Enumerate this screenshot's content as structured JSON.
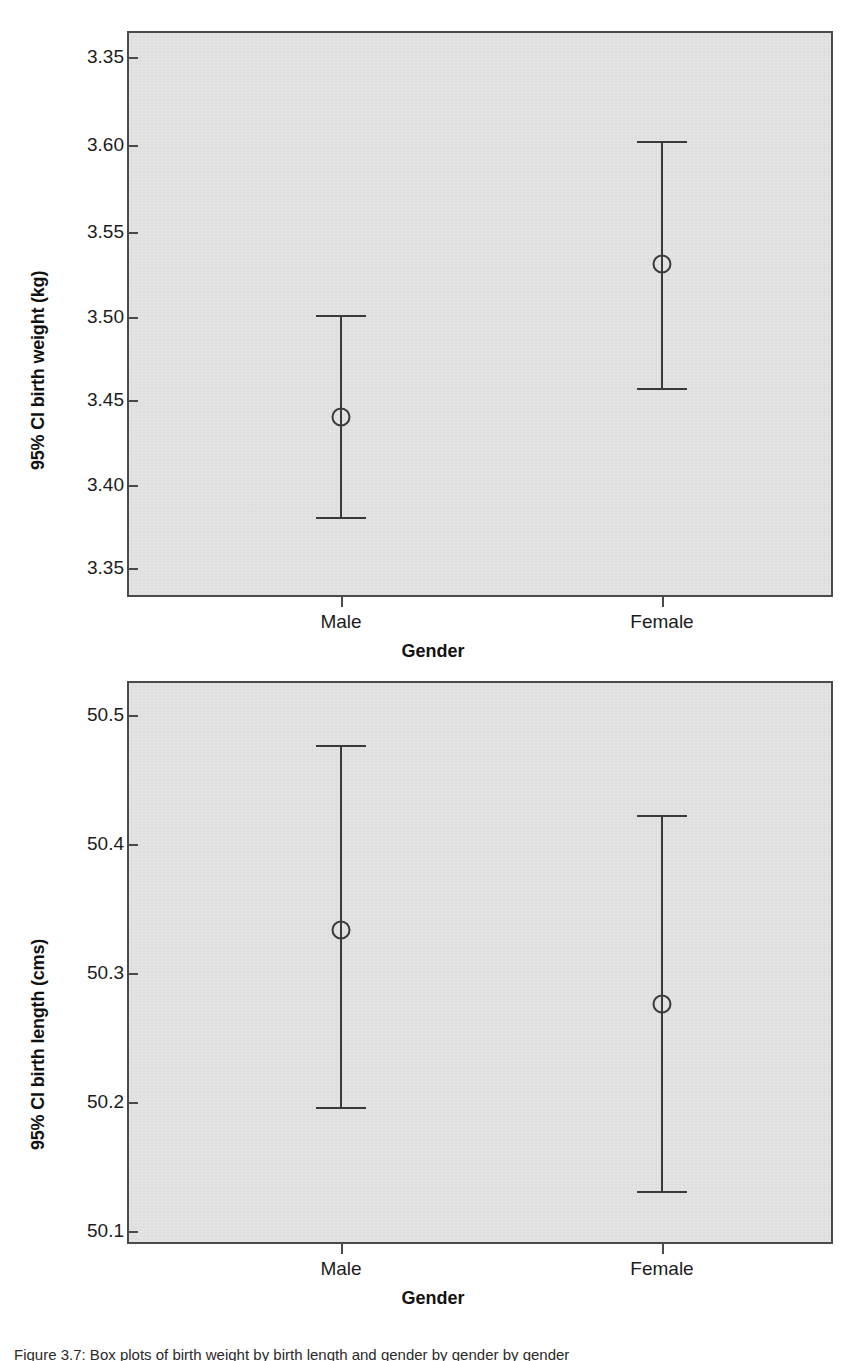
{
  "figure": {
    "caption": "Figure 3.7: Box plots of birth weight by birth length and gender by gender by gender"
  },
  "charts": [
    {
      "id": "weight",
      "ylabel": "95% CI birth weight (kg)",
      "xlabel": "Gender",
      "yticks": [
        "3.35",
        "3.60",
        "3.55",
        "3.50",
        "3.45",
        "3.40",
        "3.35"
      ],
      "xticks": [
        "Male",
        "Female"
      ]
    },
    {
      "id": "length",
      "ylabel": "95% CI birth length (cms)",
      "xlabel": "Gender",
      "yticks": [
        "50.5",
        "50.4",
        "50.3",
        "50.2",
        "50.1"
      ],
      "xticks": [
        "Male",
        "Female"
      ]
    }
  ],
  "chart_data": [
    {
      "type": "scatter",
      "subtype": "error-bar-95ci",
      "title": "",
      "xlabel": "Gender",
      "ylabel": "95% CI birth weight (kg)",
      "categories": [
        "Male",
        "Female"
      ],
      "values": [
        3.441,
        3.531
      ],
      "ci_lower": [
        3.382,
        3.458
      ],
      "ci_upper": [
        3.5,
        3.602
      ],
      "ytick_labels": [
        "3.35",
        "3.60",
        "3.55",
        "3.50",
        "3.45",
        "3.40",
        "3.35"
      ],
      "ytick_values": [
        3.65,
        3.6,
        3.55,
        3.5,
        3.45,
        3.4,
        3.35
      ],
      "ylim": [
        3.332,
        3.672
      ],
      "grid": false,
      "legend": "none",
      "note": "Topmost tick is printed as 3.35 in the source scan though the axis sequence implies 3.65"
    },
    {
      "type": "scatter",
      "subtype": "error-bar-95ci",
      "title": "",
      "xlabel": "Gender",
      "ylabel": "95% CI birth length (cms)",
      "categories": [
        "Male",
        "Female"
      ],
      "values": [
        50.333,
        50.275
      ],
      "ci_lower": [
        50.19,
        50.132
      ],
      "ci_upper": [
        50.473,
        50.42
      ],
      "ytick_labels": [
        "50.5",
        "50.4",
        "50.3",
        "50.2",
        "50.1"
      ],
      "ytick_values": [
        50.5,
        50.4,
        50.3,
        50.2,
        50.1
      ],
      "ylim": [
        50.073,
        50.543
      ],
      "grid": false,
      "legend": "none"
    }
  ]
}
